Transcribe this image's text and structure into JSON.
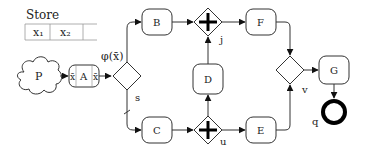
{
  "store": {
    "title": "Store",
    "cells": [
      "x₁",
      "x₂",
      ""
    ]
  },
  "nodes": {
    "P": {
      "label": "P",
      "shape": "cloud"
    },
    "A": {
      "label": "A",
      "left_mark": "x̄",
      "right_mark": "x̄"
    },
    "s": {
      "label": "s",
      "shape": "xor-gateway"
    },
    "B": {
      "label": "B"
    },
    "C": {
      "label": "C"
    },
    "j": {
      "label": "j",
      "shape": "parallel-gateway"
    },
    "u": {
      "label": "u",
      "shape": "parallel-gateway"
    },
    "D": {
      "label": "D"
    },
    "E": {
      "label": "E"
    },
    "F": {
      "label": "F"
    },
    "v": {
      "label": "v",
      "shape": "xor-gateway"
    },
    "G": {
      "label": "G"
    },
    "q": {
      "label": "q",
      "shape": "end-event"
    }
  },
  "edges": {
    "condition_label": "φ(x̄)"
  },
  "colors": {
    "stroke": "#333333",
    "fill": "#ffffff",
    "text": "#222222"
  }
}
